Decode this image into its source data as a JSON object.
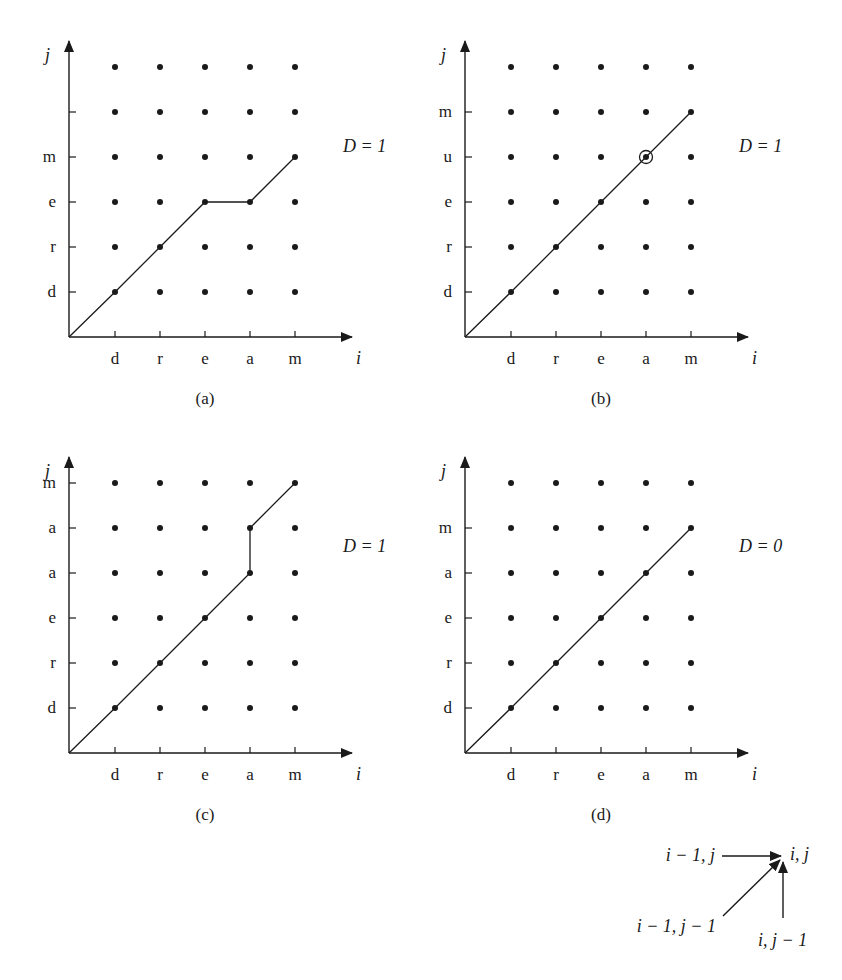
{
  "figure": {
    "axis_labels": {
      "x": "i",
      "y": "j"
    },
    "colors": {
      "ink": "#1a1a1a",
      "background": "#ffffff"
    }
  },
  "panels": [
    {
      "id": "a",
      "caption": "(a)",
      "x_labels": [
        "d",
        "r",
        "e",
        "a",
        "m"
      ],
      "y_labels": [
        "d",
        "r",
        "e",
        "m",
        ""
      ],
      "rows": 6,
      "distance_label": "D = 1",
      "path": [
        [
          0,
          0
        ],
        [
          1,
          1
        ],
        [
          2,
          2
        ],
        [
          3,
          3
        ],
        [
          4,
          3
        ],
        [
          5,
          4
        ]
      ],
      "circled": null
    },
    {
      "id": "b",
      "caption": "(b)",
      "x_labels": [
        "d",
        "r",
        "e",
        "a",
        "m"
      ],
      "y_labels": [
        "d",
        "r",
        "e",
        "u",
        "m"
      ],
      "rows": 6,
      "distance_label": "D = 1",
      "path": [
        [
          0,
          0
        ],
        [
          1,
          1
        ],
        [
          2,
          2
        ],
        [
          3,
          3
        ],
        [
          4,
          4
        ],
        [
          5,
          5
        ]
      ],
      "circled": [
        4,
        4
      ]
    },
    {
      "id": "c",
      "caption": "(c)",
      "x_labels": [
        "d",
        "r",
        "e",
        "a",
        "m"
      ],
      "y_labels": [
        "d",
        "r",
        "e",
        "a",
        "a",
        "m"
      ],
      "rows": 6,
      "distance_label": "D = 1",
      "path": [
        [
          0,
          0
        ],
        [
          1,
          1
        ],
        [
          2,
          2
        ],
        [
          3,
          3
        ],
        [
          4,
          4
        ],
        [
          4,
          5
        ],
        [
          5,
          6
        ]
      ],
      "circled": null
    },
    {
      "id": "d",
      "caption": "(d)",
      "x_labels": [
        "d",
        "r",
        "e",
        "a",
        "m"
      ],
      "y_labels": [
        "d",
        "r",
        "e",
        "a",
        "m"
      ],
      "rows": 6,
      "distance_label": "D = 0",
      "path": [
        [
          0,
          0
        ],
        [
          1,
          1
        ],
        [
          2,
          2
        ],
        [
          3,
          3
        ],
        [
          4,
          4
        ],
        [
          5,
          5
        ]
      ],
      "circled": null
    }
  ],
  "legend": {
    "target": "i, j",
    "from_left": "i − 1, j",
    "from_diag": "i − 1, j − 1",
    "from_below": "i, j − 1"
  }
}
